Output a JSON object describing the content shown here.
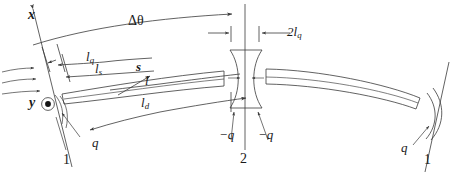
{
  "figure": {
    "type": "optics-beam-schematic",
    "width": 460,
    "height": 177,
    "background": "#ffffff",
    "line_color": "#3a3a3a",
    "text_color": "#1a1a1a"
  },
  "axes": {
    "x_label": "x",
    "y_label": "y",
    "y_marker": "out-of-page-dot"
  },
  "dimensions": {
    "delta_theta": {
      "label_base": "Δθ",
      "label_sub": ""
    },
    "l_q": {
      "label_base": "l",
      "label_sub": "q"
    },
    "l_s": {
      "label_base": "l",
      "label_sub": "s"
    },
    "l": {
      "label_base": "l",
      "label_sub": ""
    },
    "l_d": {
      "label_base": "l",
      "label_sub": "d"
    },
    "two_l_q": {
      "label_base": "2l",
      "label_sub": "q"
    }
  },
  "vectors": {
    "s": {
      "label": "s"
    }
  },
  "charges": {
    "left_q": "q",
    "center_minus_q_left": "−q",
    "center_minus_q_right": "−q",
    "right_q": "q"
  },
  "stations": {
    "left": "1",
    "center": "2",
    "right": "1"
  }
}
